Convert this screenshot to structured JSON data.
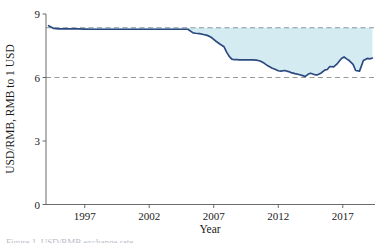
{
  "figure": {
    "background_color": "#ffffff",
    "line_color": "#2c4a80",
    "fill_color": "#d4ecf1",
    "grid_color": "#8c8c8c",
    "axis_color": "#5a5a5a",
    "text_color": "#1a1a1a"
  },
  "caption": {
    "partial_text": "Figure 1. USD/RMB exchange rate"
  },
  "chart_data": {
    "type": "area",
    "title": "",
    "xlabel": "Year",
    "ylabel": "USD/RMB, RMB to 1 USD",
    "xlim": [
      1994.0,
      2019.5
    ],
    "ylim": [
      0,
      9
    ],
    "xticks": [
      1997,
      2002,
      2007,
      2012,
      2017
    ],
    "xtick_labels": [
      "1997",
      "2002",
      "2007",
      "2012",
      "2017"
    ],
    "yticks": [
      0,
      3,
      6,
      9
    ],
    "ytick_labels": [
      "0",
      "3",
      "6",
      "9"
    ],
    "grid": false,
    "legend": "none",
    "reference_lines": [
      {
        "name": "upper-peg-line",
        "value": 8.35,
        "style": "dashed",
        "color": "#7f8a97"
      },
      {
        "name": "lower-level-line",
        "value": 6.0,
        "style": "dashed",
        "color": "#8c8c8c"
      }
    ],
    "fill_between": {
      "baseline": 8.35,
      "note": "shaded band between the 8.35 reference level and the exchange-rate curve"
    },
    "series": [
      {
        "name": "USD/RMB exchange rate",
        "color": "#2c4a80",
        "x": [
          1994.2,
          1994.6,
          1995.0,
          1995.5,
          1996.0,
          1996.5,
          1997.0,
          1997.5,
          1998.0,
          1999.0,
          2000.0,
          2001.0,
          2002.0,
          2003.0,
          2004.0,
          2005.0,
          2005.4,
          2005.6,
          2005.9,
          2006.2,
          2006.5,
          2006.8,
          2007.0,
          2007.2,
          2007.5,
          2007.8,
          2008.0,
          2008.2,
          2008.4,
          2008.6,
          2008.8,
          2009.0,
          2009.5,
          2010.0,
          2010.3,
          2010.6,
          2010.9,
          2011.2,
          2011.5,
          2011.8,
          2012.0,
          2012.2,
          2012.5,
          2012.8,
          2013.0,
          2013.3,
          2013.6,
          2013.9,
          2014.1,
          2014.3,
          2014.5,
          2014.8,
          2015.0,
          2015.3,
          2015.6,
          2015.8,
          2016.0,
          2016.3,
          2016.6,
          2016.9,
          2017.1,
          2017.3,
          2017.5,
          2017.8,
          2018.0,
          2018.3,
          2018.6,
          2018.9,
          2019.1,
          2019.3
        ],
        "y": [
          8.45,
          8.32,
          8.3,
          8.3,
          8.3,
          8.3,
          8.29,
          8.28,
          8.28,
          8.28,
          8.28,
          8.28,
          8.28,
          8.28,
          8.28,
          8.28,
          8.11,
          8.09,
          8.07,
          8.03,
          7.99,
          7.9,
          7.8,
          7.7,
          7.57,
          7.45,
          7.2,
          7.0,
          6.87,
          6.84,
          6.84,
          6.83,
          6.83,
          6.83,
          6.82,
          6.78,
          6.68,
          6.55,
          6.45,
          6.38,
          6.32,
          6.3,
          6.33,
          6.28,
          6.23,
          6.18,
          6.14,
          6.09,
          6.05,
          6.15,
          6.2,
          6.14,
          6.12,
          6.2,
          6.35,
          6.38,
          6.52,
          6.5,
          6.67,
          6.9,
          6.97,
          6.88,
          6.8,
          6.62,
          6.33,
          6.3,
          6.8,
          6.9,
          6.88,
          6.92
        ]
      }
    ]
  }
}
